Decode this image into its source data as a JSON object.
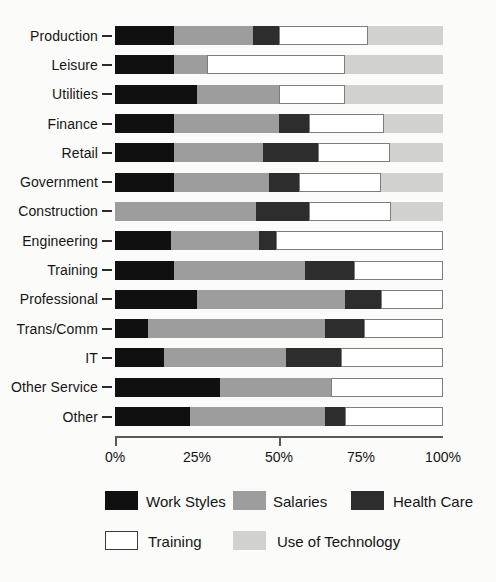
{
  "chart_data": {
    "type": "bar",
    "orientation": "horizontal",
    "stacked": true,
    "title": "",
    "xlabel": "",
    "ylabel": "",
    "xlim": [
      0,
      100
    ],
    "grid": false,
    "legend_position": "bottom",
    "categories": [
      "Production",
      "Leisure",
      "Utilities",
      "Finance",
      "Retail",
      "Government",
      "Construction",
      "Engineering",
      "Training",
      "Professional",
      "Trans/Comm",
      "IT",
      "Other Service",
      "Other"
    ],
    "series": [
      {
        "name": "Work Styles",
        "color": "#101010",
        "values": [
          18,
          18,
          25,
          18,
          18,
          18,
          0,
          17,
          18,
          25,
          10,
          15,
          32,
          23
        ]
      },
      {
        "name": "Salaries",
        "color": "#9d9d9d",
        "values": [
          24,
          10,
          25,
          32,
          27,
          29,
          43,
          27,
          40,
          45,
          54,
          37,
          34,
          41
        ]
      },
      {
        "name": "Health Care",
        "color": "#2d2d2d",
        "values": [
          8,
          0,
          0,
          9,
          17,
          9,
          16,
          5,
          15,
          11,
          12,
          17,
          0,
          6
        ]
      },
      {
        "name": "Training",
        "color": "#ffffff",
        "border_color": "#7e7e7e",
        "values": [
          27,
          42,
          20,
          23,
          22,
          25,
          25,
          51,
          27,
          19,
          24,
          31,
          34,
          30
        ]
      },
      {
        "name": "Use of Technology",
        "color": "#d1d1d0",
        "values": [
          23,
          30,
          30,
          18,
          16,
          19,
          16,
          0,
          0,
          0,
          0,
          0,
          0,
          0
        ]
      }
    ],
    "x_ticks": [
      {
        "label": "0%",
        "pos": 0
      },
      {
        "label": "25%",
        "pos": 25
      },
      {
        "label": "50%",
        "pos": 50
      },
      {
        "label": "75%",
        "pos": 75
      },
      {
        "label": "100%",
        "pos": 100
      }
    ],
    "tick_marks_at": [
      0,
      50
    ]
  },
  "legend": {
    "row1": [
      "Work Styles",
      "Salaries",
      "Health Care"
    ],
    "row2": [
      "Training",
      "Use of Technology"
    ]
  }
}
